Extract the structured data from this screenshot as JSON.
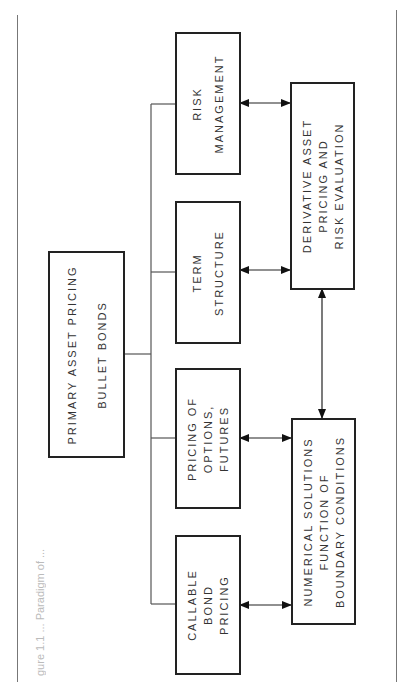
{
  "figure": {
    "caption_partial": "gure 1.1 ... Paradigm of ..."
  },
  "diagram": {
    "root": {
      "line1": "PRIMARY ASSET PRICING",
      "line2": "BULLET BONDS"
    },
    "branches": [
      {
        "id": "risk-management",
        "lines": [
          "RISK",
          "MANAGEMENT"
        ]
      },
      {
        "id": "term-structure",
        "lines": [
          "TERM",
          "STRUCTURE"
        ]
      },
      {
        "id": "pricing-options-futures",
        "lines": [
          "PRICING OF",
          "OPTIONS,",
          "FUTURES"
        ]
      },
      {
        "id": "callable-bond-pricing",
        "lines": [
          "CALLABLE",
          "BOND",
          "PRICING"
        ]
      }
    ],
    "outputs": [
      {
        "id": "derivative-asset-pricing",
        "lines": [
          "DERIVATIVE ASSET",
          "PRICING AND",
          "RISK EVALUATION"
        ]
      },
      {
        "id": "numerical-solutions",
        "lines": [
          "NUMERICAL SOLUTIONS",
          "FUNCTION OF",
          "BOUNDARY CONDITIONS"
        ]
      }
    ],
    "edges": [
      {
        "from": "primary-asset-pricing",
        "to": "risk-management",
        "type": "line"
      },
      {
        "from": "primary-asset-pricing",
        "to": "term-structure",
        "type": "line"
      },
      {
        "from": "primary-asset-pricing",
        "to": "pricing-options-futures",
        "type": "line"
      },
      {
        "from": "primary-asset-pricing",
        "to": "callable-bond-pricing",
        "type": "line"
      },
      {
        "from": "risk-management",
        "to": "derivative-asset-pricing",
        "type": "double-arrow"
      },
      {
        "from": "term-structure",
        "to": "derivative-asset-pricing",
        "type": "double-arrow"
      },
      {
        "from": "pricing-options-futures",
        "to": "numerical-solutions",
        "type": "double-arrow"
      },
      {
        "from": "callable-bond-pricing",
        "to": "numerical-solutions",
        "type": "double-arrow"
      },
      {
        "from": "derivative-asset-pricing",
        "to": "numerical-solutions",
        "type": "double-arrow"
      }
    ]
  }
}
